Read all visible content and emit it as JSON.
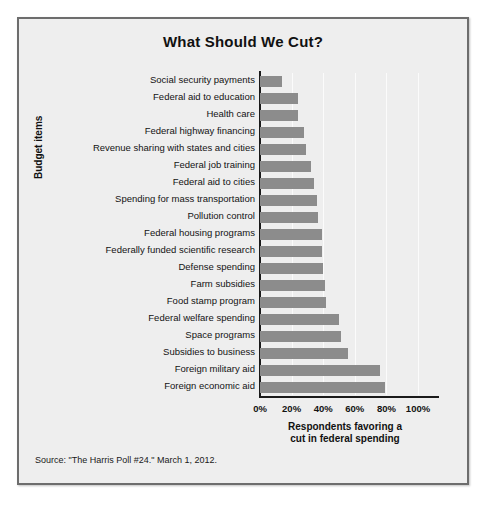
{
  "figure": {
    "title": "What Should We Cut?",
    "source": "Source: \"The Harris Poll #24.\" March 1, 2012.",
    "ylabel": "Budget items",
    "xlabel_line1": "Respondents favoring a",
    "xlabel_line2": "cut in federal spending",
    "bar_color": "#8c8c8c",
    "background_color": "#eeeeee",
    "border_color": "#6d6d6d",
    "axis_color": "#1a1a1a"
  },
  "chart_data": {
    "type": "bar",
    "orientation": "horizontal",
    "title": "What Should We Cut?",
    "xlabel": "Respondents favoring a cut in federal spending",
    "ylabel": "Budget items",
    "xlim": [
      0,
      100
    ],
    "grid": true,
    "legend": null,
    "tick_labels": [
      "0%",
      "20%",
      "40%",
      "60%",
      "80%",
      "100%"
    ],
    "tick_values": [
      0,
      20,
      40,
      60,
      80,
      100
    ],
    "categories": [
      "Social security payments",
      "Federal aid to education",
      "Health care",
      "Federal highway financing",
      "Revenue sharing with states and cities",
      "Federal job training",
      "Federal aid to cities",
      "Spending for mass transportation",
      "Pollution control",
      "Federal housing programs",
      "Federally funded scientific research",
      "Defense spending",
      "Farm subsidies",
      "Food stamp program",
      "Federal welfare spending",
      "Space programs",
      "Subsidies to business",
      "Foreign military aid",
      "Foreign economic aid"
    ],
    "values": [
      14,
      24,
      24,
      28,
      29,
      32,
      34,
      36,
      37,
      39,
      39,
      40,
      41,
      42,
      50,
      51,
      56,
      76,
      79
    ]
  }
}
